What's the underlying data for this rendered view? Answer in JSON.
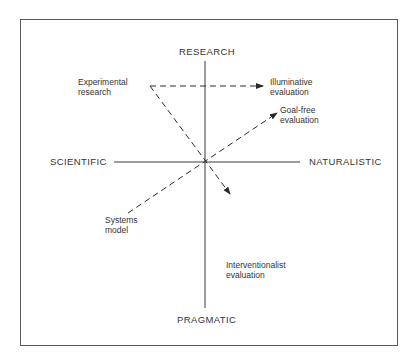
{
  "diagram": {
    "axes": {
      "top": "RESEARCH",
      "bottom": "PRAGMATIC",
      "left": "SCIENTIFIC",
      "right": "NATURALISTIC"
    },
    "nodes": {
      "experimental": {
        "line1": "Experimental",
        "line2": "research"
      },
      "illuminative": {
        "line1": "Illuminative",
        "line2": "evaluation"
      },
      "goalfree": {
        "line1": "Goal-free",
        "line2": "evaluation"
      },
      "systems": {
        "line1": "Systems",
        "line2": "model"
      },
      "interventionalist": {
        "line1": "Interventionalist",
        "line2": "evaluation"
      }
    },
    "edges": [
      {
        "from": "Experimental research",
        "to": "Illuminative evaluation",
        "style": "dashed-arrow"
      },
      {
        "from": "Experimental research",
        "to": "Interventionalist evaluation",
        "style": "dashed-arrow"
      },
      {
        "from": "Systems model",
        "to": "Goal-free evaluation",
        "style": "dashed-arrow"
      }
    ],
    "colors": {
      "line": "#3a3a3a",
      "frame": "#5a5a5a"
    }
  }
}
